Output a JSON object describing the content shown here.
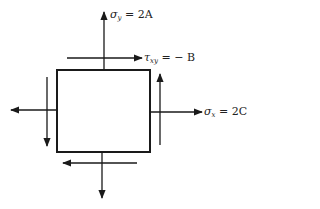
{
  "diagram": {
    "title": "",
    "element": "stress element",
    "labels": {
      "sigma_y": {
        "symbol": "σ",
        "subscript": "y",
        "value": "= 2A"
      },
      "tau_xy": {
        "symbol": "τ",
        "subscript": "xy",
        "value": "= − B"
      },
      "sigma_x": {
        "symbol": "σ",
        "subscript": "x",
        "value": "= 2C"
      }
    },
    "arrows": [
      {
        "name": "normal-stress-top",
        "direction": "up"
      },
      {
        "name": "normal-stress-bottom",
        "direction": "down"
      },
      {
        "name": "normal-stress-left",
        "direction": "left"
      },
      {
        "name": "normal-stress-right",
        "direction": "right"
      },
      {
        "name": "shear-top",
        "direction": "right"
      },
      {
        "name": "shear-bottom",
        "direction": "left"
      },
      {
        "name": "shear-left",
        "direction": "down"
      },
      {
        "name": "shear-right",
        "direction": "up"
      }
    ],
    "colors": {
      "stroke": "#1a1a1a",
      "background": "#ffffff"
    }
  }
}
